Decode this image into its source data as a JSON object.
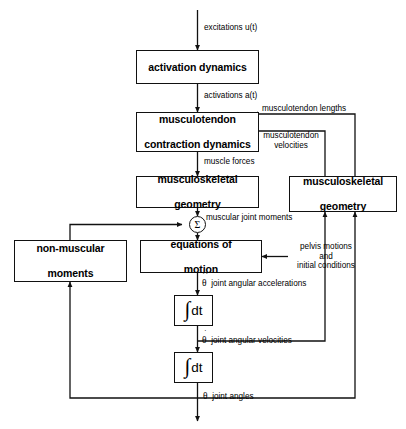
{
  "diagram": {
    "type": "flowchart",
    "background_color": "#ffffff",
    "line_color": "#111111"
  },
  "blocks": {
    "activation_dynamics": {
      "line1": "activation dynamics"
    },
    "contraction_dynamics": {
      "line1": "musculotendon",
      "line2": "contraction dynamics"
    },
    "geometry_left": {
      "line1": "musculoskeletal",
      "line2": "geometry"
    },
    "geometry_right": {
      "line1": "musculoskeletal",
      "line2": "geometry"
    },
    "non_muscular_moments": {
      "line1": "non-muscular",
      "line2": "moments"
    },
    "equations_of_motion": {
      "line1": "equations of",
      "line2": "motion"
    },
    "integrator_1": {
      "symbol": "∫",
      "operand": "dt"
    },
    "integrator_2": {
      "symbol": "∫",
      "operand": "dt"
    },
    "summation": {
      "symbol": "Σ"
    }
  },
  "signals": {
    "excitations": "excitations u(t)",
    "activations": "activations a(t)",
    "muscle_forces": "muscle forces",
    "musculotendon_lengths": "musculotendon lengths",
    "musculotendon_velocities_line1": "musculotendon",
    "musculotendon_velocities_line2": "velocities",
    "muscular_joint_moments": "muscular joint moments",
    "pelvis_line1": "pelvis motions",
    "pelvis_line2": "and",
    "pelvis_line3": "initial conditions",
    "joint_angular_accelerations": "joint angular accelerations",
    "joint_angular_velocities": "joint angular velocities",
    "joint_angles": "joint angles",
    "theta_accel_symbol": "θ",
    "theta_accel_dots": "··",
    "theta_vel_symbol": "θ",
    "theta_vel_dots": "·",
    "theta_symbol": "θ"
  }
}
